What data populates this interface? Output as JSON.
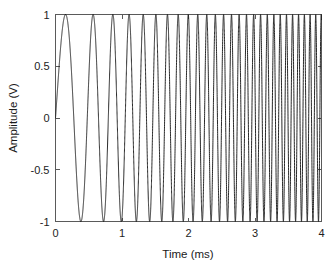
{
  "chart_data": {
    "type": "line",
    "title": "",
    "subtitle": "",
    "xlabel": "Time (ms)",
    "ylabel": "Amplitude (V)",
    "xlim": [
      0,
      4
    ],
    "ylim": [
      -1,
      1
    ],
    "xticks": [
      0,
      1,
      2,
      3,
      4
    ],
    "xticklabels": [
      "0",
      "1",
      "2",
      "3",
      "4"
    ],
    "yticks": [
      -1,
      -0.5,
      0,
      0.5,
      1
    ],
    "yticklabels": [
      "-1",
      "-0.5",
      "0",
      "0.5",
      "1"
    ],
    "grid": false,
    "legend": null,
    "legend_position": "none",
    "box": true,
    "series": [
      {
        "name": "chirp",
        "color": "#1c1c1c",
        "linewidth": 0.95,
        "description": "Linear frequency sweep (chirp), unit amplitude sine starting at zero phase",
        "model": {
          "form": "y(t) = sin(2*pi*(f0*t + 0.5*k*t^2))",
          "f0_kHz": 1.45,
          "f1_kHz": 12.2,
          "k_kHz_per_ms": 2.6875,
          "t_start_ms": 0,
          "t_end_ms": 4,
          "amplitude_V": 1
        },
        "landmarks": {
          "first_peak_ms": 0.345,
          "first_trough_ms": 0.68,
          "second_peak_ms": 0.88,
          "cycles_0_to_1ms": 2,
          "cycles_1_to_2ms": 5,
          "cycles_2_to_3ms": 8.5,
          "cycles_3_to_4ms": 11,
          "total_cycles": 26.5
        }
      }
    ]
  },
  "axes": {
    "x_label": "Time (ms)",
    "y_label": "Amplitude (V)"
  },
  "colors": {
    "background": "#ffffff",
    "axis": "#5a5a5a",
    "curve": "#1c1c1c",
    "text": "#222222"
  }
}
